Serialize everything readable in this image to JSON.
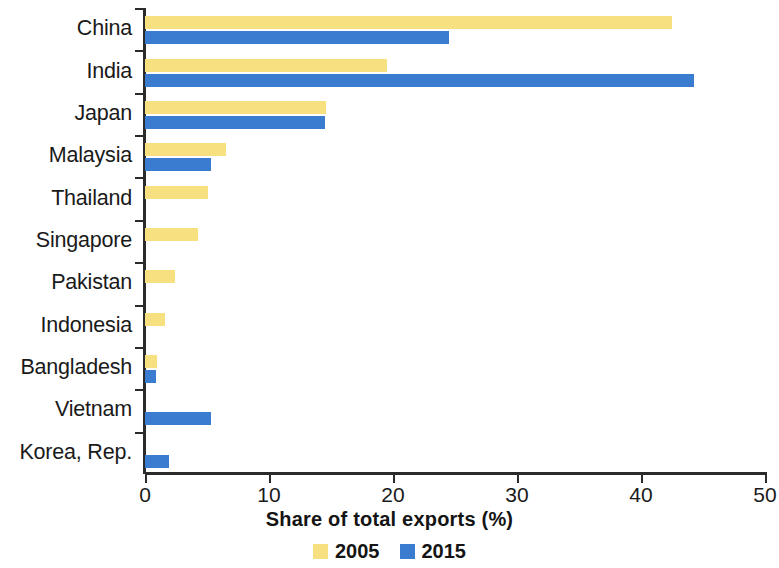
{
  "chart_data": {
    "type": "bar",
    "orientation": "horizontal",
    "title": "",
    "xlabel": "Share of total exports (%)",
    "ylabel": "",
    "xlim": [
      0,
      50
    ],
    "xticks": [
      0,
      10,
      20,
      30,
      40,
      50
    ],
    "xtick_labels": [
      "0",
      "10",
      "20",
      "30",
      "40",
      "50"
    ],
    "grid": false,
    "legend_position": "bottom",
    "colors": {
      "2005": "#f7e07f",
      "2015": "#3a7dd0",
      "axis": "#2b2b2b",
      "text": "#1a1a1a"
    },
    "categories": [
      "China",
      "India",
      "Japan",
      "Malaysia",
      "Thailand",
      "Singapore",
      "Pakistan",
      "Indonesia",
      "Bangladesh",
      "Vietnam",
      "Korea, Rep."
    ],
    "series": [
      {
        "name": "2005",
        "color": "#f7e07f",
        "values": [
          42.5,
          19.5,
          14.6,
          6.5,
          5.1,
          4.3,
          2.4,
          1.6,
          1.0,
          0,
          0
        ]
      },
      {
        "name": "2015",
        "color": "#3a7dd0",
        "values": [
          24.5,
          44.3,
          14.5,
          5.3,
          0,
          0,
          0,
          0,
          0.9,
          5.3,
          1.9
        ]
      }
    ]
  },
  "legend": {
    "items": [
      {
        "label": "2005",
        "color": "#f7e07f"
      },
      {
        "label": "2015",
        "color": "#3a7dd0"
      }
    ]
  }
}
